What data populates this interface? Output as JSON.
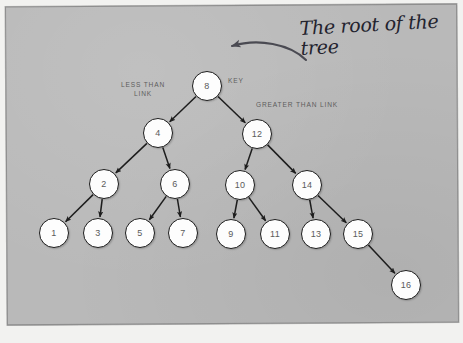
{
  "diagram": {
    "title_annotation": "The root of\nthe tree",
    "labels": {
      "key": "KEY",
      "less_than_link": "LESS THAN\nLINK",
      "greater_than_link": "GREATER THAN LINK"
    },
    "colors": {
      "background": "#b9b9b9",
      "node_fill": "#fdfdfd",
      "node_stroke": "#1d1d1d",
      "node_text": "#5a5a5a",
      "caps_label_text": "#5d5d5d",
      "handwriting": "#23232e",
      "page_surround": "#f2f2f0"
    },
    "nodes": [
      {
        "id": "n8",
        "label": "8",
        "x": 207,
        "y": 86
      },
      {
        "id": "n4",
        "label": "4",
        "x": 158,
        "y": 133
      },
      {
        "id": "n12",
        "label": "12",
        "x": 257,
        "y": 134
      },
      {
        "id": "n2",
        "label": "2",
        "x": 104,
        "y": 184
      },
      {
        "id": "n6",
        "label": "6",
        "x": 175,
        "y": 184
      },
      {
        "id": "n10",
        "label": "10",
        "x": 240,
        "y": 185
      },
      {
        "id": "n14",
        "label": "14",
        "x": 307,
        "y": 185
      },
      {
        "id": "n1",
        "label": "1",
        "x": 54,
        "y": 233
      },
      {
        "id": "n3",
        "label": "3",
        "x": 98,
        "y": 233
      },
      {
        "id": "n5",
        "label": "5",
        "x": 140,
        "y": 233
      },
      {
        "id": "n7",
        "label": "7",
        "x": 183,
        "y": 233
      },
      {
        "id": "n9",
        "label": "9",
        "x": 231,
        "y": 234
      },
      {
        "id": "n11",
        "label": "11",
        "x": 275,
        "y": 234
      },
      {
        "id": "n13",
        "label": "13",
        "x": 316,
        "y": 234
      },
      {
        "id": "n15",
        "label": "15",
        "x": 358,
        "y": 234
      },
      {
        "id": "n16",
        "label": "16",
        "x": 406,
        "y": 285
      }
    ],
    "edges": [
      {
        "from": "n8",
        "to": "n4",
        "kind": "less"
      },
      {
        "from": "n8",
        "to": "n12",
        "kind": "greater"
      },
      {
        "from": "n4",
        "to": "n2",
        "kind": "less"
      },
      {
        "from": "n4",
        "to": "n6",
        "kind": "greater"
      },
      {
        "from": "n12",
        "to": "n10",
        "kind": "less"
      },
      {
        "from": "n12",
        "to": "n14",
        "kind": "greater"
      },
      {
        "from": "n2",
        "to": "n1",
        "kind": "less"
      },
      {
        "from": "n2",
        "to": "n3",
        "kind": "greater"
      },
      {
        "from": "n6",
        "to": "n5",
        "kind": "less"
      },
      {
        "from": "n6",
        "to": "n7",
        "kind": "greater"
      },
      {
        "from": "n10",
        "to": "n9",
        "kind": "less"
      },
      {
        "from": "n10",
        "to": "n11",
        "kind": "greater"
      },
      {
        "from": "n14",
        "to": "n13",
        "kind": "less"
      },
      {
        "from": "n14",
        "to": "n15",
        "kind": "greater"
      },
      {
        "from": "n15",
        "to": "n16",
        "kind": "greater"
      }
    ]
  }
}
